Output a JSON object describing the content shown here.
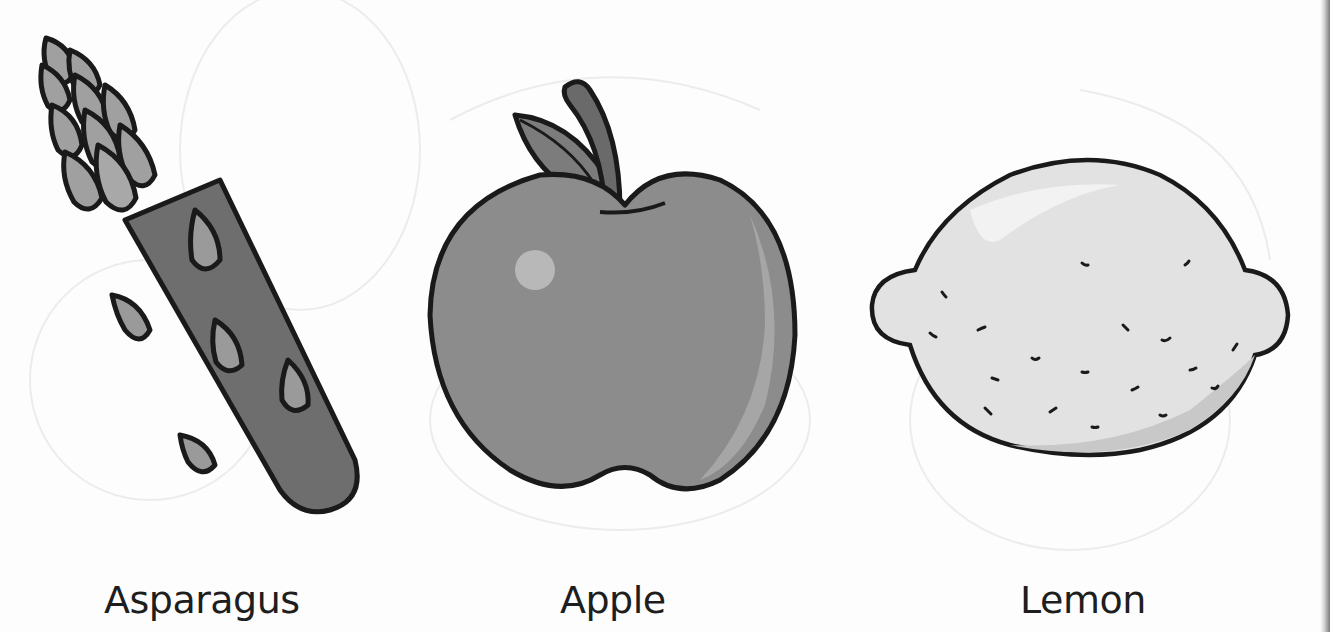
{
  "items": [
    {
      "label": "Asparagus",
      "illustration": "asparagus-illustration"
    },
    {
      "label": "Apple",
      "illustration": "apple-illustration"
    },
    {
      "label": "Lemon",
      "illustration": "lemon-illustration"
    }
  ],
  "colors": {
    "outline": "#1a1a1a",
    "asparagus_body": "#6e6e6e",
    "asparagus_tip": "#9a9a9a",
    "apple_body": "#8c8c8c",
    "apple_highlight": "#b8b8b8",
    "lemon_body": "#e2e2e2",
    "background": "#fdfdfd"
  }
}
